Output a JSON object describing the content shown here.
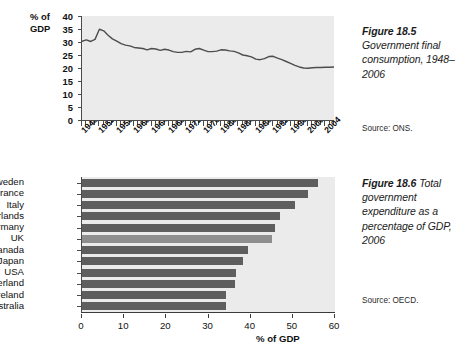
{
  "figure_185": {
    "caption_label": "Figure 18.5",
    "caption_text": "Government final consumption, 1948–2006",
    "source": "Source: ONS.",
    "y_axis_title_line1": "% of",
    "y_axis_title_line2": "GDP"
  },
  "figure_186": {
    "caption_label": "Figure 18.6",
    "caption_text": "Total government expenditure as a percentage of GDP, 2006",
    "source": "Source: OECD.",
    "x_axis_title": "% of GDP"
  },
  "chart_data": [
    {
      "type": "line",
      "title": "Government final consumption, 1948–2006",
      "xlabel": "",
      "ylabel": "% of GDP",
      "ylim": [
        0,
        40
      ],
      "yticks": [
        0,
        5,
        10,
        15,
        20,
        25,
        30,
        35,
        40
      ],
      "xlim": [
        1948,
        2006
      ],
      "xticks": [
        1948,
        1952,
        1956,
        1960,
        1964,
        1968,
        1972,
        1976,
        1980,
        1984,
        1988,
        1992,
        1996,
        2000,
        2004
      ],
      "grid": false,
      "legend": "none",
      "source": "ONS",
      "x": [
        1948,
        1949,
        1950,
        1951,
        1952,
        1953,
        1954,
        1955,
        1956,
        1957,
        1958,
        1959,
        1960,
        1961,
        1962,
        1963,
        1964,
        1965,
        1966,
        1967,
        1968,
        1969,
        1970,
        1971,
        1972,
        1973,
        1974,
        1975,
        1976,
        1977,
        1978,
        1979,
        1980,
        1981,
        1982,
        1983,
        1984,
        1985,
        1986,
        1987,
        1988,
        1989,
        1990,
        1991,
        1992,
        1993,
        1994,
        1995,
        1996,
        1997,
        1998,
        1999,
        2000,
        2001,
        2002,
        2003,
        2004,
        2005,
        2006
      ],
      "values": [
        30.3,
        30.8,
        30.2,
        31.0,
        34.9,
        34.3,
        32.6,
        31.2,
        30.3,
        29.4,
        28.8,
        28.5,
        27.9,
        27.7,
        27.5,
        27.0,
        27.5,
        27.3,
        26.8,
        27.2,
        26.9,
        26.3,
        26.0,
        26.0,
        26.4,
        26.2,
        27.2,
        27.5,
        26.9,
        26.3,
        26.3,
        26.5,
        27.0,
        26.9,
        26.6,
        26.4,
        25.8,
        25.0,
        24.7,
        24.3,
        23.4,
        23.2,
        23.6,
        24.4,
        24.5,
        23.8,
        23.2,
        22.5,
        21.8,
        21.0,
        20.4,
        20.0,
        19.9,
        20.1,
        20.2,
        20.2,
        20.3,
        20.3,
        20.4
      ]
    },
    {
      "type": "bar",
      "orientation": "horizontal",
      "title": "Total government expenditure as a percentage of GDP, 2006",
      "xlabel": "% of GDP",
      "ylabel": "",
      "xlim": [
        0,
        60
      ],
      "xticks": [
        0,
        10,
        20,
        30,
        40,
        50,
        60
      ],
      "grid": false,
      "legend": "none",
      "source": "OECD",
      "highlight_category": "UK",
      "bar_color": "#5e5e5e",
      "highlight_color": "#8e8e8e",
      "categories": [
        "Sweden",
        "France",
        "Italy",
        "Netherlands",
        "Germany",
        "UK",
        "Canada",
        "Japan",
        "USA",
        "Switzerland",
        "Ireland",
        "Australia"
      ],
      "values": [
        56.0,
        53.7,
        50.4,
        46.9,
        45.8,
        45.1,
        39.4,
        38.2,
        36.5,
        36.2,
        34.2,
        34.2
      ]
    }
  ]
}
